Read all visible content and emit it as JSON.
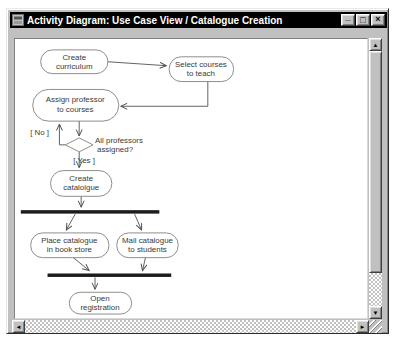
{
  "window": {
    "title": "Activity Diagram: Use Case View / Catalogue Creation",
    "buttons": {
      "minimize": "_",
      "maximize": "□",
      "close": "×"
    }
  },
  "scrollbar": {
    "up": "▲",
    "down": "▼",
    "left": "◄",
    "right": "►"
  },
  "colors": {
    "titlebar_bg": "#000000",
    "titlebar_text": "#ffffff",
    "chrome": "#c0c0c0",
    "canvas_bg": "#ffffff",
    "node_fill": "#ffffff",
    "node_stroke": "#7f7f7f",
    "edge": "#4f4f4f",
    "sync_bar": "#1c1c1c",
    "text": "#3a3a3a"
  },
  "diagram": {
    "nodes": {
      "create_curriculum": {
        "l1": "Create",
        "l2": "curriculum"
      },
      "select_courses": {
        "l1": "Select courses",
        "l2": "to teach"
      },
      "assign_professor": {
        "l1": "Assign professor",
        "l2": "to courses"
      },
      "create_catalogue": {
        "l1": "Create",
        "l2": "catalolgue"
      },
      "place_catalogue": {
        "l1": "Place catalogue",
        "l2": "in book store"
      },
      "mail_catalogue": {
        "l1": "Mail catalogue",
        "l2": "to students"
      },
      "open_registration": {
        "l1": "Open",
        "l2": "registration"
      }
    },
    "decision": {
      "l1": "All professors",
      "l2": "assigned?"
    },
    "guards": {
      "no": "[ No ]",
      "yes": "[ Yes ]"
    }
  }
}
